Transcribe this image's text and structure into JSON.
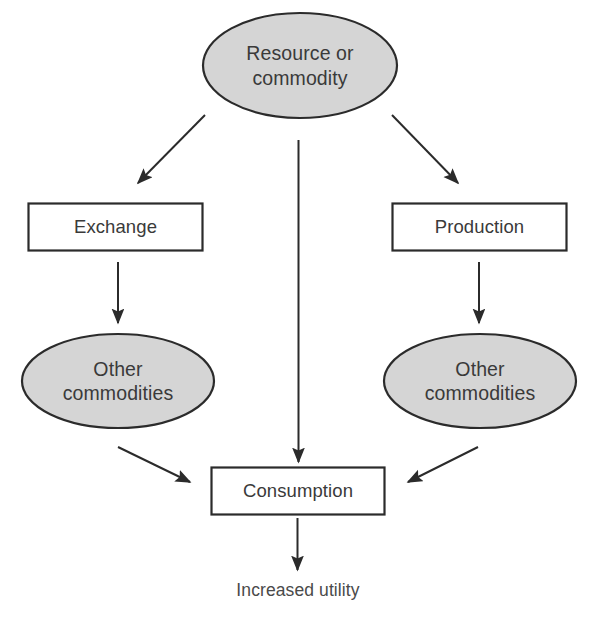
{
  "diagram": {
    "background_color": "#ffffff",
    "node_fill_ellipse": "#d5d5d5",
    "node_fill_box": "#ffffff",
    "stroke_color": "#2b2b2b",
    "text_color": "#3a3a3a",
    "nodes": {
      "resource": {
        "label": "Resource or\ncommodity",
        "shape": "ellipse"
      },
      "exchange": {
        "label": "Exchange",
        "shape": "rectangle"
      },
      "production": {
        "label": "Production",
        "shape": "rectangle"
      },
      "other_commodities_left": {
        "label": "Other\ncommodities",
        "shape": "ellipse"
      },
      "other_commodities_right": {
        "label": "Other\ncommodities",
        "shape": "ellipse"
      },
      "consumption": {
        "label": "Consumption",
        "shape": "rectangle"
      },
      "increased_utility": {
        "label": "Increased utility",
        "shape": "text"
      }
    },
    "edges": [
      {
        "from": "resource",
        "to": "exchange",
        "direction": "down-left"
      },
      {
        "from": "resource",
        "to": "consumption",
        "direction": "down"
      },
      {
        "from": "resource",
        "to": "production",
        "direction": "down-right"
      },
      {
        "from": "exchange",
        "to": "other_commodities_left",
        "direction": "down"
      },
      {
        "from": "production",
        "to": "other_commodities_right",
        "direction": "down"
      },
      {
        "from": "other_commodities_left",
        "to": "consumption",
        "direction": "down-right"
      },
      {
        "from": "other_commodities_right",
        "to": "consumption",
        "direction": "down-left"
      },
      {
        "from": "consumption",
        "to": "increased_utility",
        "direction": "down"
      }
    ]
  }
}
